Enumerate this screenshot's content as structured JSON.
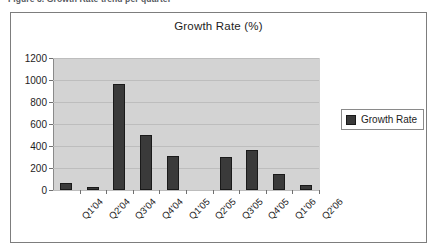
{
  "clipped_caption": "Figure 3. Growth Rate trend per quarter",
  "legend": {
    "position": "right",
    "entries": [
      {
        "label": "Growth Rate",
        "color": "#3a3a3a"
      }
    ]
  },
  "colors": {
    "bar": "#3a3a3a",
    "bar_border": "#1a1a1a",
    "plot_background": "#d3d3d3",
    "gridline": "#bdbdbd",
    "axis": "#8a8a8a",
    "frame_border": "#7d7d7d",
    "text": "#1d1d1d"
  },
  "chart_data": {
    "type": "bar",
    "title": "Growth Rate (%)",
    "xlabel": "",
    "ylabel": "",
    "categories": [
      "Q1'04",
      "Q2'04",
      "Q3'04",
      "Q4'04",
      "Q1'05",
      "Q2'05",
      "Q3'05",
      "Q4'05",
      "Q1'06",
      "Q2'06"
    ],
    "series": [
      {
        "name": "Growth Rate",
        "values": [
          65,
          25,
          960,
          500,
          310,
          0,
          300,
          360,
          150,
          45
        ]
      }
    ],
    "ylim": [
      0,
      1200
    ],
    "yticks": [
      0,
      200,
      400,
      600,
      800,
      1000,
      1200
    ],
    "ytick_labels": [
      "0",
      "200",
      "400",
      "600",
      "800",
      "1000",
      "1200"
    ],
    "grid": true,
    "legend_position": "right"
  }
}
